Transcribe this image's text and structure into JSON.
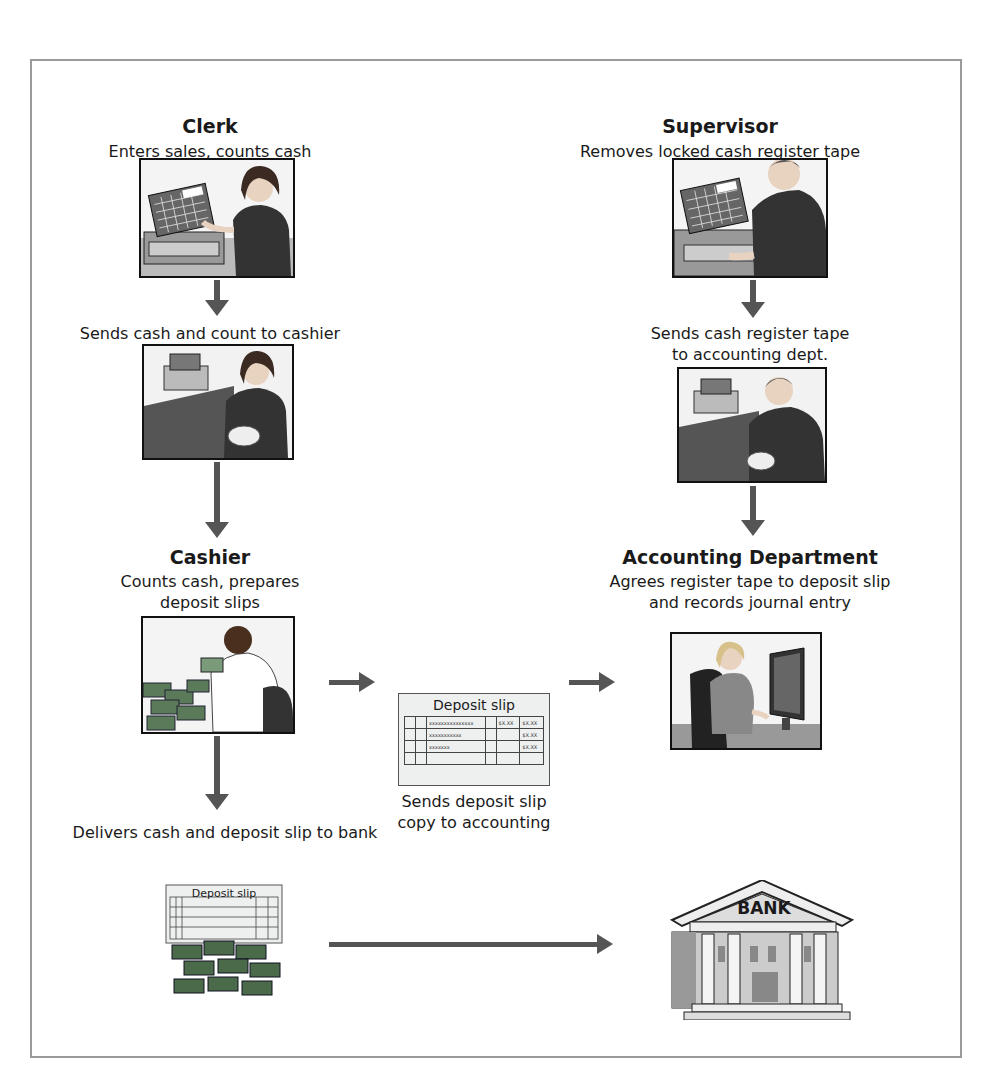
{
  "diagram": {
    "type": "flowchart",
    "nodes": {
      "clerk": {
        "title": "Clerk",
        "caption": "Enters sales, counts cash",
        "image": "clerk-at-register"
      },
      "clerk_send": {
        "caption": "Sends cash and count to cashier",
        "image": "clerk-with-receipt-tape"
      },
      "supervisor": {
        "title": "Supervisor",
        "caption": "Removes locked cash register tape",
        "image": "supervisor-at-register"
      },
      "supervisor_send": {
        "caption_line1": "Sends cash register tape",
        "caption_line2": "to accounting dept.",
        "image": "supervisor-with-tape"
      },
      "cashier": {
        "title": "Cashier",
        "caption_line1": "Counts cash, prepares",
        "caption_line2": "deposit slips",
        "image": "cashier-counting-cash"
      },
      "deposit_slip": {
        "label": "Deposit slip",
        "caption_line1": "Sends deposit slip",
        "caption_line2": "copy to accounting",
        "rows": [
          "xxxxxxxxxxxxxxx",
          "xxxxxxxxxxx",
          "xxxxxxx"
        ],
        "amounts": [
          [
            "$X.XX",
            "$X.XX"
          ],
          [
            "",
            "$X.XX"
          ],
          [
            "",
            "$X.XX"
          ]
        ]
      },
      "accounting": {
        "title": "Accounting Department",
        "caption_line1": "Agrees register tape to deposit slip",
        "caption_line2": "and records journal entry",
        "image": "accountant-at-computer"
      },
      "deliver": {
        "caption": "Delivers cash and deposit slip to bank",
        "slip_label": "Deposit slip",
        "image": "deposit-slip-and-cash"
      },
      "bank": {
        "label": "BANK",
        "image": "bank-building"
      }
    },
    "edges": [
      {
        "from": "clerk",
        "to": "clerk_send"
      },
      {
        "from": "clerk_send",
        "to": "cashier"
      },
      {
        "from": "supervisor",
        "to": "supervisor_send"
      },
      {
        "from": "supervisor_send",
        "to": "accounting"
      },
      {
        "from": "cashier",
        "to": "deposit_slip"
      },
      {
        "from": "deposit_slip",
        "to": "accounting"
      },
      {
        "from": "cashier",
        "to": "deliver"
      },
      {
        "from": "deliver",
        "to": "bank"
      }
    ]
  },
  "colors": {
    "arrow": "#555555",
    "frame": "#9a9a9a"
  }
}
